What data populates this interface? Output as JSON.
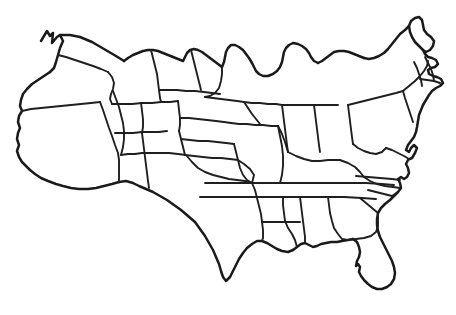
{
  "figure": {
    "kind": "map",
    "style": "hand-drawn black ink line sketch",
    "background_color": "#ffffff",
    "line_color": "#1a1a1a",
    "has_labels": false,
    "has_legend": false,
    "has_title_text": false,
    "has_scale_bar": false,
    "has_compass": false,
    "has_fill_color": false,
    "width_px": 456,
    "height_px": 315
  },
  "map_extent": {
    "left_px": 14,
    "top_px": 14,
    "right_px": 444,
    "bottom_px": 292
  },
  "regions": [
    {
      "name": "pacific-northwest",
      "data_name": "region-pacific-northwest"
    },
    {
      "name": "california",
      "data_name": "region-california"
    },
    {
      "name": "mountain-west",
      "data_name": "region-mountain-west"
    },
    {
      "name": "great-plains",
      "data_name": "region-great-plains"
    },
    {
      "name": "texas",
      "data_name": "region-texas"
    },
    {
      "name": "great-lakes",
      "data_name": "region-great-lakes"
    },
    {
      "name": "northeast",
      "data_name": "region-northeast"
    },
    {
      "name": "southeast",
      "data_name": "region-southeast"
    },
    {
      "name": "florida",
      "data_name": "region-florida"
    }
  ],
  "features": {
    "national_outline": "national-outline",
    "state_borders": "state-borders",
    "great_lakes_shoreline": "great-lakes-shoreline",
    "florida_peninsula": "florida-peninsula",
    "maine_tip": "maine-tip",
    "cape_cod": "cape-cod",
    "puget_sound": "puget-sound",
    "chesapeake_bay": "chesapeake-bay",
    "gulf_coast": "gulf-coast"
  }
}
